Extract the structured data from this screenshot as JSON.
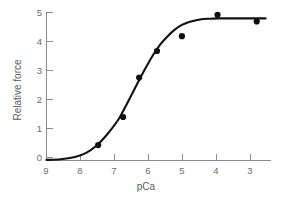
{
  "chart_data": {
    "type": "scatter",
    "title": "",
    "subtitle": "",
    "xlabel": "pCa",
    "ylabel": "Relative force",
    "xlim": [
      9,
      2.7
    ],
    "ylim": [
      0,
      5
    ],
    "x_ticks": [
      9,
      8,
      7,
      6,
      5,
      4,
      3
    ],
    "x_tick_labels": [
      "9",
      "8",
      "7",
      "6",
      "5",
      "4",
      "3"
    ],
    "y_ticks": [
      0,
      1,
      2,
      3,
      4,
      5
    ],
    "y_tick_labels": [
      "0",
      "1",
      "2",
      "3",
      "4",
      "5"
    ],
    "x_axis_inverted": true,
    "grid": false,
    "legend": null,
    "annotations": [],
    "series": [
      {
        "name": "Relative force",
        "marker": "filled-circle",
        "marker_color": "#111111",
        "x": [
          7.55,
          6.85,
          6.4,
          5.9,
          5.2,
          4.2,
          3.1
        ],
        "y": [
          0.52,
          1.47,
          2.8,
          3.7,
          4.2,
          4.92,
          4.7
        ]
      },
      {
        "name": "sigmoid fit",
        "marker": "none",
        "line_color": "#111111",
        "x": [
          9.0,
          8.6,
          8.2,
          7.9,
          7.6,
          7.3,
          7.0,
          6.8,
          6.6,
          6.4,
          6.2,
          6.0,
          5.8,
          5.6,
          5.4,
          5.2,
          5.0,
          4.8,
          4.6,
          4.4,
          4.2,
          4.0,
          3.6,
          3.2,
          2.85
        ],
        "y": [
          0.02,
          0.04,
          0.12,
          0.25,
          0.5,
          0.88,
          1.35,
          1.78,
          2.25,
          2.72,
          3.17,
          3.58,
          3.93,
          4.2,
          4.42,
          4.58,
          4.68,
          4.74,
          4.78,
          4.79,
          4.8,
          4.8,
          4.8,
          4.8,
          4.8
        ]
      }
    ]
  },
  "axes": {
    "x_label": "pCa",
    "y_label": "Relative force"
  },
  "colors": {
    "axis": "#8c8c8c",
    "tick_text": "#6b6b6b",
    "data": "#111111",
    "background": "#ffffff"
  }
}
